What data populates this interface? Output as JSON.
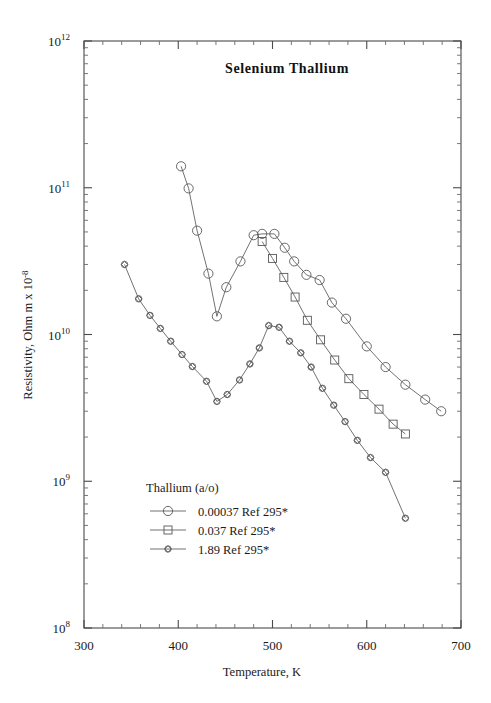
{
  "chart_data": {
    "type": "line",
    "title": "Selenium  Thallium",
    "xlabel": "Temperature,  K",
    "ylabel": "Resistivity, Ohm m x 10",
    "ylabel_exponent": "-8",
    "xlim": [
      300,
      700
    ],
    "ylim": [
      100000000.0,
      1000000000000.0
    ],
    "yscale": "log",
    "xscale": "linear",
    "grid": false,
    "x_major_ticks": [
      300,
      400,
      500,
      600,
      700
    ],
    "x_major_tick_labels": [
      "300",
      "400",
      "500",
      "600",
      "700"
    ],
    "x_minor_tick_step": 20,
    "y_major_ticks": [
      100000000.0,
      1000000000.0,
      10000000000.0,
      100000000000.0,
      1000000000000.0
    ],
    "y_major_tick_labels": [
      "10",
      "10",
      "10",
      "10",
      "10"
    ],
    "y_major_tick_exponents": [
      "8",
      "9",
      "10",
      "11",
      "12"
    ],
    "legend_position": "lower-left-inside",
    "legend_title": "Thallium (a/o)",
    "series": [
      {
        "name": "0.00037 Ref 295*",
        "label": "0.00037 Ref 295*",
        "marker": "circle",
        "marker_size": 4.6,
        "x": [
          403,
          411,
          420,
          432,
          441,
          451,
          466,
          480,
          489,
          502,
          513,
          523,
          536,
          550,
          563,
          578,
          600,
          620,
          641,
          662,
          679
        ],
        "y": [
          140000000000.0,
          99000000000.0,
          51000000000.0,
          26000000000.0,
          13300000000.0,
          21000000000.0,
          31500000000.0,
          47500000000.0,
          48500000000.0,
          48500000000.0,
          39000000000.0,
          31500000000.0,
          25500000000.0,
          23500000000.0,
          16500000000.0,
          12800000000.0,
          8300000000.0,
          6000000000.0,
          4550000000.0,
          3600000000.0,
          3000000000.0
        ]
      },
      {
        "name": "0.037 Ref 295*",
        "label": "0.037 Ref 295*",
        "marker": "square",
        "marker_size": 4.0,
        "x": [
          489,
          500,
          512,
          524,
          537,
          551,
          566,
          581,
          597,
          613,
          628,
          641
        ],
        "y": [
          43000000000.0,
          33000000000.0,
          24500000000.0,
          18000000000.0,
          12500000000.0,
          9200000000.0,
          6700000000.0,
          5000000000.0,
          3900000000.0,
          3100000000.0,
          2450000000.0,
          2100000000.0
        ]
      },
      {
        "name": "1.89 Ref 295*",
        "label": "1.89 Ref 295*",
        "marker": "diamond",
        "marker_size": 3.2,
        "x": [
          343,
          358,
          370,
          381,
          392,
          404,
          415,
          430,
          441,
          452,
          465,
          476,
          486,
          496,
          507,
          518,
          530,
          541,
          553,
          565,
          577,
          590,
          604,
          620,
          641
        ],
        "y": [
          30000000000.0,
          17500000000.0,
          13500000000.0,
          11000000000.0,
          9000000000.0,
          7300000000.0,
          6050000000.0,
          4800000000.0,
          3500000000.0,
          3900000000.0,
          4900000000.0,
          6300000000.0,
          8100000000.0,
          11500000000.0,
          11200000000.0,
          9000000000.0,
          7500000000.0,
          6000000000.0,
          4300000000.0,
          3300000000.0,
          2550000000.0,
          1900000000.0,
          1450000000.0,
          1150000000.0,
          560000000.0
        ]
      }
    ]
  },
  "colors": {
    "axis": "#4a4a4a",
    "series": "#585858",
    "text": "#1a1a1a",
    "background": "#ffffff"
  }
}
